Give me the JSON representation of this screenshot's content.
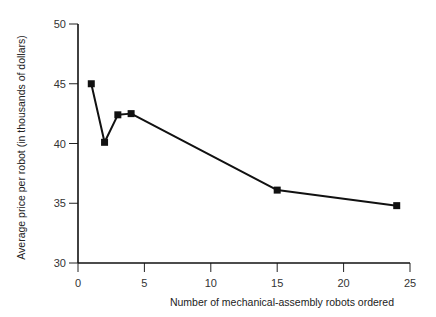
{
  "chart_data": {
    "type": "line",
    "title": "",
    "xlabel": "Number of mechanical-assembly robots ordered",
    "ylabel": "Average price per robot (in thousands of dollars)",
    "xlim": [
      0,
      25
    ],
    "ylim": [
      30,
      50
    ],
    "xticks": [
      0,
      5,
      10,
      15,
      20,
      25
    ],
    "yticks": [
      30,
      35,
      40,
      45,
      50
    ],
    "xtick_labels": [
      "0",
      "5",
      "10",
      "15",
      "20",
      "25"
    ],
    "ytick_labels": [
      "30",
      "35",
      "40",
      "45",
      "50"
    ],
    "grid": false,
    "legend": null,
    "series": [
      {
        "name": "Average price",
        "marker": "square",
        "color": "#111111",
        "x": [
          1,
          2,
          3,
          4,
          15,
          24
        ],
        "y": [
          45.0,
          40.1,
          42.4,
          42.5,
          36.1,
          34.8
        ]
      }
    ]
  }
}
